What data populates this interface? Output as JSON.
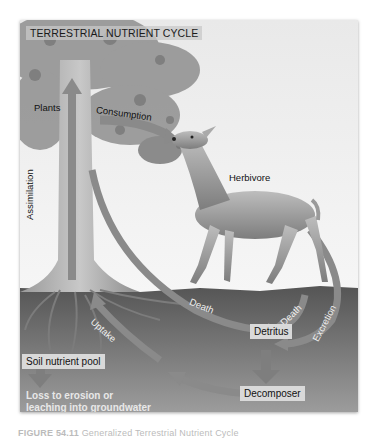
{
  "figure": {
    "title": "TERRESTRIAL NUTRIENT CYCLE",
    "caption_number": "FIGURE 54.11",
    "caption_text": "Generalized Terrestrial Nutrient Cycle",
    "colors": {
      "sky": "#ececec",
      "soil_top": "#5a5a5a",
      "soil_bottom": "#9a9a9a",
      "arrow": "#8a8a8a",
      "label_box": "#d9d9d9"
    }
  },
  "nodes": {
    "plants": "Plants",
    "herbivore": "Herbivore",
    "detritus": "Detritus",
    "decomposer": "Decomposer",
    "soil_pool": "Soil nutrient pool",
    "loss_line1": "Loss to erosion or",
    "loss_line2": "leaching into groundwater"
  },
  "flows": {
    "consumption": "Consumption",
    "assimilation": "Assimilation",
    "uptake": "Uptake",
    "plant_death": "Death",
    "herbivore_death": "Death",
    "excretion": "Excretion"
  }
}
